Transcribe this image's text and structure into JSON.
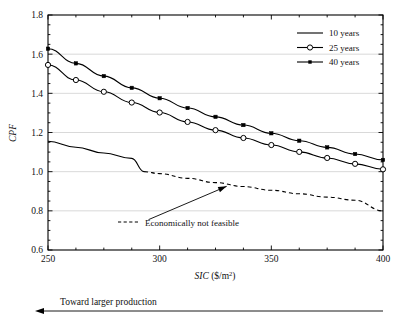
{
  "chart_data": {
    "type": "line",
    "title": "",
    "xlabel": "SIC ($/m2)",
    "xlabel_base": "SIC",
    "xlabel_unit_pre": " ($/m",
    "xlabel_unit_sup": "2",
    "xlabel_unit_post": ")",
    "ylabel": "CPF",
    "xlim": [
      250,
      400
    ],
    "ylim": [
      0.6,
      1.8
    ],
    "xticks": [
      250,
      300,
      350,
      400
    ],
    "xtick_labels": [
      "250",
      "300",
      "350",
      "400"
    ],
    "yticks": [
      0.6,
      0.8,
      1.0,
      1.2,
      1.4,
      1.6,
      1.8
    ],
    "ytick_labels": [
      "0.6",
      "0.8",
      "1.0",
      "1.2",
      "1.4",
      "1.6",
      "1.8"
    ],
    "x_minor_step": 12.5,
    "y_minor_step": 0.05,
    "grid": "horizontal-major",
    "grid_color": "#cfcfcf",
    "axis_color": "#000000",
    "legend_position": "top-right",
    "x": [
      250,
      262.5,
      275,
      287.5,
      300,
      312.5,
      325,
      337.5,
      350,
      362.5,
      375,
      387.5,
      400
    ],
    "series": [
      {
        "name": "10 years",
        "marker": "none",
        "style": "solid-then-dashed",
        "color": "#000000",
        "values": [
          1.155,
          1.125,
          1.095,
          1.068,
          1.043,
          1.018,
          0.995,
          0.973,
          0.952,
          0.932,
          0.913,
          0.895,
          0.878
        ],
        "dash_split_x": 293,
        "dash_split_y": 1.0
      },
      {
        "name": "25 years",
        "marker": "open-circle",
        "style": "solid",
        "color": "#000000",
        "values": [
          1.545,
          1.468,
          1.408,
          1.353,
          1.302,
          1.254,
          1.212,
          1.172,
          1.136,
          1.101,
          1.07,
          1.04,
          1.012
        ]
      },
      {
        "name": "40 years",
        "marker": "filled-square",
        "style": "solid",
        "color": "#000000",
        "values": [
          1.628,
          1.553,
          1.488,
          1.428,
          1.375,
          1.325,
          1.28,
          1.238,
          1.196,
          1.158,
          1.124,
          1.09,
          1.06
        ]
      }
    ],
    "annotations": [
      {
        "name": "economically-not-feasible",
        "text": "Economically not feasible",
        "sample": "dashed-line",
        "arrow_from_x": 295,
        "arrow_from_y": 0.755,
        "arrow_to_x": 330,
        "arrow_to_y": 0.925
      }
    ],
    "dashed_feasibility_curve": {
      "name": "economically-not-feasible-curve",
      "x": [
        293,
        300,
        312.5,
        325,
        337.5,
        350,
        362.5,
        375,
        387.5,
        400
      ],
      "values": [
        1.0,
        0.99,
        0.966,
        0.944,
        0.924,
        0.905,
        0.887,
        0.87,
        0.854,
        0.8
      ]
    }
  },
  "legend": {
    "entries": [
      {
        "label": "10 years",
        "marker": "none"
      },
      {
        "label": "25 years",
        "marker": "open-circle"
      },
      {
        "label": "40 years",
        "marker": "filled-square"
      }
    ]
  },
  "footer": {
    "arrow_label": "Toward larger production",
    "arrow_direction": "left"
  }
}
